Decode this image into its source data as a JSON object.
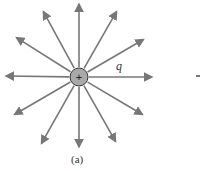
{
  "diagram": {
    "charge": {
      "symbol": "+",
      "label": "q",
      "center": [
        79,
        77
      ],
      "radius": 9,
      "fill": "#a9a9a9",
      "stroke": "#333333"
    },
    "field_lines": {
      "color": "#777777",
      "count": 12,
      "tips": [
        [
          79,
          1
        ],
        [
          42,
          9
        ],
        [
          118,
          9
        ],
        [
          14,
          36
        ],
        [
          146,
          38
        ],
        [
          3,
          76
        ],
        [
          155,
          77
        ],
        [
          12,
          116
        ],
        [
          145,
          116
        ],
        [
          40,
          146
        ],
        [
          79,
          150
        ],
        [
          117,
          144
        ]
      ]
    },
    "caption": "(a)"
  }
}
